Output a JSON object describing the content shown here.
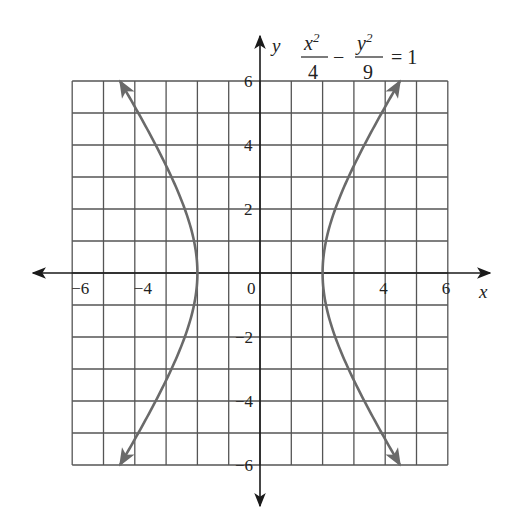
{
  "chart_data": {
    "type": "line",
    "equation": {
      "num1_var": "x",
      "num1_exp": "2",
      "den1": "4",
      "minus": "−",
      "num2_var": "y",
      "num2_exp": "2",
      "den2": "9",
      "rhs": "= 1"
    },
    "xlabel": "x",
    "ylabel": "y",
    "xlim": [
      -6,
      6
    ],
    "ylim": [
      -6,
      6
    ],
    "grid": true,
    "grid_step": 1,
    "x_ticks": [
      {
        "value": -6,
        "label": "−6"
      },
      {
        "value": -4,
        "label": "−4"
      },
      {
        "value": 0,
        "label": "0"
      },
      {
        "value": 4,
        "label": "4"
      },
      {
        "value": 6,
        "label": "6"
      }
    ],
    "y_ticks": [
      {
        "value": 6,
        "label": "6"
      },
      {
        "value": 4,
        "label": "4"
      },
      {
        "value": 2,
        "label": "2"
      },
      {
        "value": -2,
        "label": "−2"
      },
      {
        "value": -4,
        "label": "−4"
      },
      {
        "value": -6,
        "label": "−6"
      }
    ],
    "series": [
      {
        "name": "right branch",
        "a": 2,
        "b": 3,
        "branch": 1,
        "x": [
          4.47,
          3.61,
          2.83,
          2.24,
          2.0,
          2.24,
          2.83,
          3.61,
          4.47
        ],
        "y": [
          6,
          4,
          2,
          0.5,
          0,
          -0.5,
          -2,
          -4,
          -6
        ]
      },
      {
        "name": "left branch",
        "a": 2,
        "b": 3,
        "branch": -1,
        "x": [
          -4.47,
          -3.61,
          -2.83,
          -2.24,
          -2.0,
          -2.24,
          -2.83,
          -3.61,
          -4.47
        ],
        "y": [
          6,
          4,
          2,
          0.5,
          0,
          -0.5,
          -2,
          -4,
          -6
        ]
      }
    ],
    "colors": {
      "grid": "#555555",
      "axis": "#1a1a1a",
      "curve": "#6a6a6a"
    }
  }
}
